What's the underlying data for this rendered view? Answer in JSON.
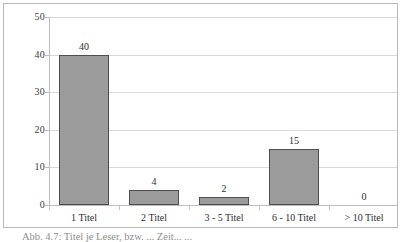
{
  "chart_data": {
    "type": "bar",
    "title": "",
    "xlabel": "",
    "ylabel": "",
    "categories": [
      "1 Titel",
      "2 Titel",
      "3 - 5 Titel",
      "6 - 10 Titel",
      "> 10 Titel"
    ],
    "values": [
      40,
      4,
      2,
      15,
      0
    ],
    "value_labels": [
      "40",
      "4",
      "2",
      "15",
      "0"
    ],
    "ylim": [
      0,
      50
    ],
    "yticks": [
      0,
      10,
      20,
      30,
      40,
      50
    ],
    "ytick_labels": [
      "0",
      "10",
      "20",
      "30",
      "40",
      "50"
    ],
    "grid": true,
    "grid_axis": "y",
    "legend": false,
    "bar_color": "#9b9b9b",
    "bar_border_color": "#4d4d4d",
    "gridline_color": "#d9d9d9",
    "axis_color": "#bdbdbd",
    "text_color": "#2e2e2e"
  },
  "caption": {
    "text": "Abb. 4.7: Titel je Leser, bzw. ... Zeit... ..."
  }
}
